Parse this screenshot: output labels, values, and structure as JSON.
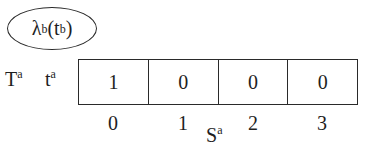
{
  "node": {
    "symbol": "λ",
    "sup1": "b",
    "paren_open": "(t",
    "sup2": "b",
    "paren_close": ")"
  },
  "row_labels": {
    "T": "T",
    "T_sup": "a",
    "t": "t",
    "t_sup": "a"
  },
  "array": {
    "cells": [
      "1",
      "0",
      "0",
      "0"
    ],
    "indices": [
      "0",
      "1",
      "2",
      "3"
    ],
    "axis_label": "S",
    "axis_sup": "a"
  }
}
